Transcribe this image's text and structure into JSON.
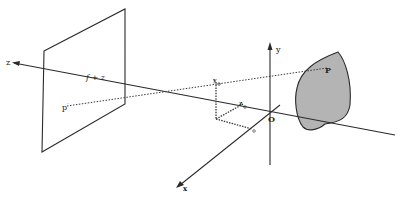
{
  "diagram": {
    "type": "perspective-projection",
    "colors": {
      "line": "#2a2a2a",
      "dotted": "#3a3a3a",
      "object_fill": "#b4b4b4",
      "background": "#ffffff"
    },
    "axes": {
      "z": {
        "label": "z"
      },
      "y": {
        "label": "y"
      },
      "x": {
        "label": "x"
      },
      "origin": {
        "label": "O"
      }
    },
    "labels": {
      "focal_distance": "f + z",
      "image_point": "p",
      "image_point_prime": "′",
      "world_point": "P",
      "y_o": "y",
      "y_o_sub": "o",
      "z_o": "z",
      "z_o_sub": "o",
      "x_o_sub": "o"
    },
    "nodes": [
      {
        "id": "image-plane",
        "label": "image plane"
      },
      {
        "id": "object",
        "label": "object"
      },
      {
        "id": "P",
        "label": "P"
      },
      {
        "id": "p-prime",
        "label": "p′"
      },
      {
        "id": "O",
        "label": "O"
      }
    ],
    "edges": [
      {
        "from": "p-prime",
        "to": "P",
        "style": "dotted"
      }
    ]
  }
}
